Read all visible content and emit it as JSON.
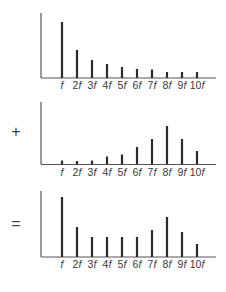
{
  "operators": [
    "",
    "+",
    "="
  ],
  "chart_data": [
    {
      "type": "bar",
      "title": "Spectrum 1",
      "categories": [
        "f",
        "2f",
        "3f",
        "4f",
        "5f",
        "6f",
        "7f",
        "8f",
        "9f",
        "10f"
      ],
      "values": [
        56,
        28,
        18,
        14,
        11,
        9,
        8.5,
        6,
        6,
        6
      ],
      "xlabel": "",
      "ylabel": "",
      "grid": false
    },
    {
      "type": "bar",
      "title": "Spectrum 2",
      "categories": [
        "f",
        "2f",
        "3f",
        "4f",
        "5f",
        "6f",
        "7f",
        "8f",
        "9f",
        "10f"
      ],
      "values": [
        4,
        3.5,
        4,
        8,
        10,
        17.5,
        25.5,
        38.5,
        25.5,
        13.5
      ],
      "xlabel": "",
      "ylabel": "",
      "grid": false
    },
    {
      "type": "bar",
      "title": "Sum spectrum",
      "categories": [
        "f",
        "2f",
        "3f",
        "4f",
        "5f",
        "6f",
        "7f",
        "8f",
        "9f",
        "10f"
      ],
      "values": [
        60,
        30,
        20,
        20,
        20,
        20,
        27,
        40,
        25,
        13
      ],
      "xlabel": "",
      "ylabel": "",
      "grid": false
    }
  ],
  "layout": {
    "panels": [
      {
        "axis_top": 13,
        "baseline": 78,
        "label_y": 89,
        "op_y": 0
      },
      {
        "axis_top": 102,
        "baseline": 164.5,
        "label_y": 176,
        "op_y": 137
      },
      {
        "axis_top": 191,
        "baseline": 257,
        "label_y": 268,
        "op_y": 229
      }
    ],
    "axis_x": 41,
    "axis_end_x": 216,
    "bar_x": [
      62,
      77,
      92,
      107,
      122,
      137,
      152,
      167,
      182,
      197
    ],
    "op_x": 16,
    "color": "#2b2b2b"
  }
}
